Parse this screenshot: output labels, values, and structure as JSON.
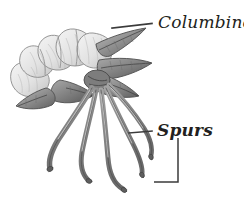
{
  "figure": {
    "background_color": "#ffffff",
    "width": 244,
    "height": 212,
    "ink_color": "#231f20",
    "line_color": "#3b3b3b",
    "illustration_tone_light": "#e8e8e8",
    "illustration_tone_mid": "#b0b0b0",
    "illustration_tone_dark": "#6e6e6e"
  },
  "labels": {
    "columbine": {
      "text": "Columbine",
      "style": "italic"
    },
    "spurs": {
      "text": "Spurs",
      "style": "bold-italic"
    }
  }
}
